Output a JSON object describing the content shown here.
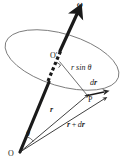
{
  "figure": {
    "kind": "vector-diagram",
    "background_color": "#ffffff",
    "ink_color": "#1a1a1a",
    "thin_line_color": "#555555",
    "width": 127,
    "height": 165
  },
  "labels": {
    "omega": "ω",
    "o_prime": "O′",
    "r_sin_theta": "r sin θ",
    "dr": "dr",
    "dr_d": "d",
    "dr_r": "r",
    "point_p": "P",
    "r": "r",
    "r_plus_dr_r1": "r",
    "r_plus_dr_plus": "+",
    "r_plus_dr_d": "d",
    "r_plus_dr_r2": "r",
    "theta": "θ",
    "origin": "O"
  },
  "elements": {
    "rotation_axis": {
      "name": "ω axis vector",
      "from": [
        20,
        152
      ],
      "to": [
        78,
        12
      ],
      "style": "thick solid with arrowhead, dashed where hidden behind disc"
    },
    "disc_ellipse": {
      "name": "circular path of P (ellipse in perspective)",
      "center": [
        62,
        60
      ],
      "rx": 59,
      "ry": 26,
      "rotation_deg": 17
    },
    "radius_segment": {
      "name": "perpendicular radius from axis to P",
      "from": [
        59,
        62
      ],
      "to": [
        88,
        95
      ],
      "label": "r sin θ"
    },
    "position_vector_r": {
      "name": "position vector r",
      "from": [
        20,
        152
      ],
      "to": [
        88,
        96
      ]
    },
    "position_vector_r_plus_dr": {
      "name": "position vector r + dr",
      "from": [
        20,
        152
      ],
      "to": [
        106,
        99
      ]
    },
    "displacement_dr": {
      "name": "displacement dr",
      "from": [
        88,
        96
      ],
      "to": [
        106,
        92
      ]
    },
    "right_angle_mark": {
      "name": "right angle at O′",
      "at": [
        59,
        62
      ]
    },
    "angle_theta": {
      "name": "angle between axis and r at origin",
      "at": [
        20,
        152
      ]
    }
  }
}
